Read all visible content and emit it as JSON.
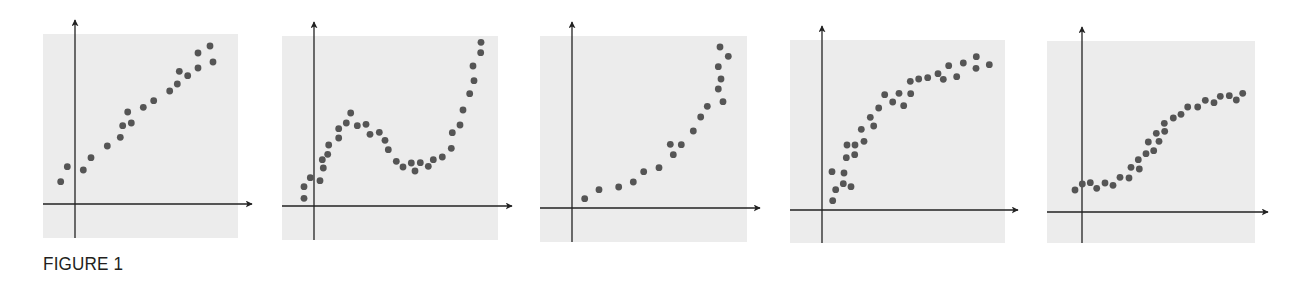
{
  "figure": {
    "caption": "FIGURE 1",
    "colors": {
      "panel_bg": "#ececec",
      "dot": "#555555",
      "axis": "#222222"
    }
  },
  "chart_data": [
    {
      "type": "scatter",
      "title": "",
      "xlabel": "",
      "ylabel": "",
      "grid": false,
      "description": "linear trend",
      "panel": {
        "box": [
          43,
          34,
          238,
          238
        ],
        "origin": [
          75,
          204
        ],
        "x_arrow_tip": 252,
        "y_arrow_tip": 20
      },
      "points_px": [
        [
          60.7,
          181.7
        ],
        [
          67.3,
          166.7
        ],
        [
          83.3,
          170
        ],
        [
          91,
          157.7
        ],
        [
          107.3,
          146
        ],
        [
          120.3,
          137.3
        ],
        [
          122.7,
          125.7
        ],
        [
          127.7,
          112
        ],
        [
          131.3,
          123
        ],
        [
          143.3,
          107.3
        ],
        [
          153.7,
          100.7
        ],
        [
          169.7,
          91
        ],
        [
          177.3,
          84
        ],
        [
          179.3,
          71.3
        ],
        [
          187.7,
          75.7
        ],
        [
          198,
          53
        ],
        [
          198,
          68
        ],
        [
          210,
          46
        ],
        [
          213,
          62
        ]
      ]
    },
    {
      "type": "scatter",
      "title": "",
      "xlabel": "",
      "ylabel": "",
      "grid": false,
      "description": "cubic trend (rise, dip, rise)",
      "panel": {
        "box": [
          282,
          36,
          498,
          240
        ],
        "origin": [
          314,
          206
        ],
        "x_arrow_tip": 512,
        "y_arrow_tip": 22
      },
      "points_px": [
        [
          304,
          198.3
        ],
        [
          304,
          186.7
        ],
        [
          310.3,
          177.7
        ],
        [
          320,
          180.7
        ],
        [
          323.3,
          168
        ],
        [
          322.3,
          159.7
        ],
        [
          327.7,
          154.3
        ],
        [
          328.7,
          145
        ],
        [
          338.7,
          138
        ],
        [
          338.7,
          128.7
        ],
        [
          346.3,
          123
        ],
        [
          350.7,
          113
        ],
        [
          357.3,
          125.7
        ],
        [
          366,
          124.3
        ],
        [
          370,
          134.3
        ],
        [
          379.3,
          132.3
        ],
        [
          385,
          140.3
        ],
        [
          388.3,
          149.7
        ],
        [
          396.3,
          161.3
        ],
        [
          403,
          167
        ],
        [
          411.3,
          163
        ],
        [
          415,
          171
        ],
        [
          420.3,
          162.7
        ],
        [
          428.3,
          166.3
        ],
        [
          433.3,
          159.7
        ],
        [
          442.3,
          157
        ],
        [
          451.3,
          148.3
        ],
        [
          452.3,
          132.7
        ],
        [
          460,
          125
        ],
        [
          463,
          110
        ],
        [
          469.7,
          93.7
        ],
        [
          474,
          80.7
        ],
        [
          473,
          66
        ],
        [
          480.7,
          52.7
        ],
        [
          481,
          42.3
        ]
      ]
    },
    {
      "type": "scatter",
      "title": "",
      "xlabel": "",
      "ylabel": "",
      "grid": false,
      "description": "exponential growth trend",
      "panel": {
        "box": [
          540,
          36,
          747,
          242
        ],
        "origin": [
          572,
          208
        ],
        "x_arrow_tip": 760,
        "y_arrow_tip": 22
      },
      "points_px": [
        [
          584.7,
          198.7
        ],
        [
          599,
          189.7
        ],
        [
          618.7,
          187
        ],
        [
          633.3,
          182
        ],
        [
          643.7,
          171.7
        ],
        [
          659,
          167.7
        ],
        [
          670.3,
          144.3
        ],
        [
          673.3,
          154.7
        ],
        [
          681.3,
          144.7
        ],
        [
          693.3,
          131
        ],
        [
          700.7,
          117
        ],
        [
          707.3,
          106.3
        ],
        [
          718.3,
          89
        ],
        [
          723,
          101.7
        ],
        [
          721,
          79
        ],
        [
          718.3,
          66.7
        ],
        [
          728.3,
          56.3
        ],
        [
          720,
          47
        ]
      ]
    },
    {
      "type": "scatter",
      "title": "",
      "xlabel": "",
      "ylabel": "",
      "grid": false,
      "description": "logarithmic / saturating trend",
      "panel": {
        "box": [
          790,
          40,
          1005,
          243
        ],
        "origin": [
          822,
          210
        ],
        "x_arrow_tip": 1018,
        "y_arrow_tip": 26
      },
      "points_px": [
        [
          832.7,
          200.7
        ],
        [
          835.7,
          189.7
        ],
        [
          832,
          171.7
        ],
        [
          843.3,
          183.7
        ],
        [
          844,
          173
        ],
        [
          851,
          186.7
        ],
        [
          846.3,
          157.7
        ],
        [
          847,
          145
        ],
        [
          855,
          145
        ],
        [
          854.7,
          154.7
        ],
        [
          861.3,
          129.3
        ],
        [
          864,
          141.3
        ],
        [
          870.3,
          117.3
        ],
        [
          873.7,
          126
        ],
        [
          878.7,
          108
        ],
        [
          884.7,
          94.7
        ],
        [
          892.7,
          102
        ],
        [
          899,
          93.3
        ],
        [
          903.7,
          105.7
        ],
        [
          910.7,
          93.7
        ],
        [
          910.3,
          81.3
        ],
        [
          918.7,
          79
        ],
        [
          927.7,
          77.7
        ],
        [
          938,
          73.7
        ],
        [
          943.3,
          79.3
        ],
        [
          948.7,
          65.7
        ],
        [
          956.7,
          76.7
        ],
        [
          963.3,
          63
        ],
        [
          976.3,
          56.7
        ],
        [
          976,
          68.3
        ],
        [
          989.3,
          64.7
        ]
      ]
    },
    {
      "type": "scatter",
      "title": "",
      "xlabel": "",
      "ylabel": "",
      "grid": false,
      "description": "logistic (S-shaped) trend",
      "panel": {
        "box": [
          1047,
          41,
          1255,
          243
        ],
        "origin": [
          1082,
          212
        ],
        "x_arrow_tip": 1268,
        "y_arrow_tip": 27
      },
      "points_px": [
        [
          1075,
          190
        ],
        [
          1082.3,
          184
        ],
        [
          1090.3,
          182.7
        ],
        [
          1096.7,
          188.3
        ],
        [
          1105,
          183
        ],
        [
          1113,
          185.3
        ],
        [
          1120,
          177.3
        ],
        [
          1129,
          178
        ],
        [
          1131,
          167.3
        ],
        [
          1139.3,
          169
        ],
        [
          1138.3,
          159.7
        ],
        [
          1146,
          153.7
        ],
        [
          1153.7,
          150.7
        ],
        [
          1148.3,
          142
        ],
        [
          1159,
          141.3
        ],
        [
          1156.3,
          133.3
        ],
        [
          1164.7,
          131.3
        ],
        [
          1164.3,
          123.3
        ],
        [
          1173.3,
          118
        ],
        [
          1181,
          114.3
        ],
        [
          1187.7,
          107
        ],
        [
          1197.7,
          107
        ],
        [
          1205.3,
          100.3
        ],
        [
          1214,
          102.7
        ],
        [
          1220.3,
          96.3
        ],
        [
          1229.3,
          95.7
        ],
        [
          1236.3,
          100
        ],
        [
          1242.7,
          93.3
        ]
      ]
    }
  ]
}
